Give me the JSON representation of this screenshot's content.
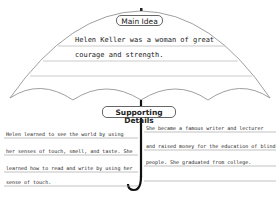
{
  "main_idea": {
    "label": "Main Idea",
    "lines": [
      "Helen Keller was a woman of great",
      "courage and strength."
    ]
  },
  "supporting_details": {
    "label": "Supporting Details",
    "left": {
      "lines": [
        "Helen learned to see the world by using",
        "her senses of touch, smell, and taste. She",
        "learned how to read and write by using her",
        "sense of touch."
      ]
    },
    "right": {
      "lines": [
        "She became a famous writer and lecturer",
        "and raised money for the education of blind",
        "people. She graduated from college."
      ]
    }
  }
}
